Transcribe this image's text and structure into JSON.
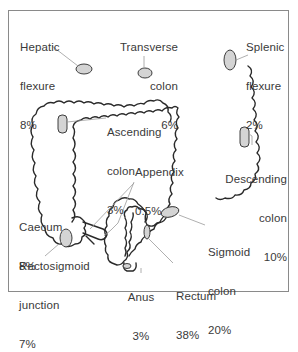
{
  "figure": {
    "type": "anatomical-diagram",
    "colors": {
      "outline": "#2a2a2a",
      "lesion_fill": "#d4d4d4",
      "leader_line": "#9a9a9a",
      "frame": "#8a8a8a",
      "text": "#3a3a3a"
    }
  },
  "labels": {
    "hepatic_flexure": {
      "name1": "Hepatic",
      "name2": "flexure",
      "pct": "8%"
    },
    "transverse_colon": {
      "name1": "Transverse",
      "name2": "colon",
      "pct": "6%"
    },
    "splenic_flexure": {
      "name1": "Splenic",
      "name2": "flexure",
      "pct": "2%"
    },
    "ascending_colon": {
      "name1": "Ascending",
      "name2": "colon",
      "pct": "3%"
    },
    "appendix": {
      "name1": "Appendix",
      "pct": "0.5%"
    },
    "descending_colon": {
      "name1": "Descending",
      "name2": "colon",
      "pct": "10%"
    },
    "caecum": {
      "name1": "Caecum",
      "pct": "8%"
    },
    "rectosigmoid_junction": {
      "name1": "Rectosigmoid",
      "name2": "junction",
      "pct": "7%"
    },
    "sigmoid_colon": {
      "name1": "Sigmoid",
      "name2": "colon",
      "pct": "20%"
    },
    "anus": {
      "name1": "Anus",
      "pct": "3%"
    },
    "rectum": {
      "name1": "Rectum",
      "pct": "38%"
    }
  }
}
